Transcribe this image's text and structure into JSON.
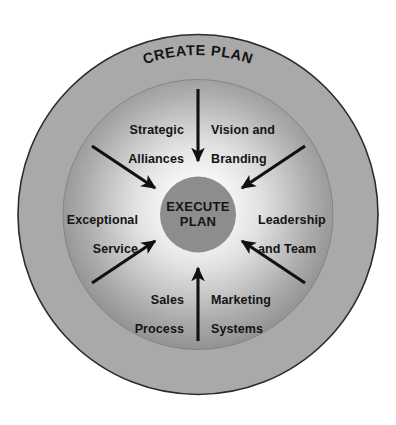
{
  "diagram": {
    "type": "concentric-cycle",
    "title": "CREATE PLAN",
    "center": {
      "line1": "EXECUTE",
      "line2": "PLAN"
    },
    "colors": {
      "outer_ring": "#a9a9a9",
      "outer_ring_stroke": "#2b2b2b",
      "inner_disc_center": "#fbfbfb",
      "inner_disc_edge": "#9a9a9a",
      "center_circle": "#8d8d8d",
      "arrow": "#111111",
      "text": "#141414",
      "background": "#ffffff"
    },
    "nodes": [
      {
        "id": "strategic-alliances",
        "line1": "Strategic",
        "line2": "Alliances",
        "position": "top-left",
        "align": "right"
      },
      {
        "id": "vision-and-branding",
        "line1": "Vision and",
        "line2": "Branding",
        "position": "top-right",
        "align": "left"
      },
      {
        "id": "exceptional-service",
        "line1": "Exceptional",
        "line2": "Service",
        "position": "left",
        "align": "right"
      },
      {
        "id": "leadership-and-team",
        "line1": "Leadership",
        "line2": "and Team",
        "position": "right",
        "align": "left"
      },
      {
        "id": "sales-process",
        "line1": "Sales",
        "line2": "Process",
        "position": "bottom-left",
        "align": "right"
      },
      {
        "id": "marketing-systems",
        "line1": "Marketing",
        "line2": "Systems",
        "position": "bottom-right",
        "align": "left"
      }
    ],
    "arrows": [
      {
        "id": "arrow-top-down",
        "direction": "down",
        "points_to": "center"
      },
      {
        "id": "arrow-bottom-up",
        "direction": "up",
        "points_to": "center"
      },
      {
        "id": "arrow-upper-left-in",
        "direction": "down-right",
        "points_to": "center"
      },
      {
        "id": "arrow-upper-right-in",
        "direction": "down-left",
        "points_to": "center"
      },
      {
        "id": "arrow-lower-left-in",
        "direction": "up-right",
        "points_to": "center"
      },
      {
        "id": "arrow-lower-right-in",
        "direction": "up-left",
        "points_to": "center"
      }
    ]
  }
}
